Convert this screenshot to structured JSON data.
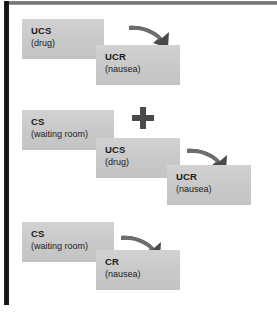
{
  "figure": {
    "colors": {
      "box_fill": "#c9c9c9",
      "box_shadow": "#dcdcdc",
      "text": "#1b1b1b",
      "arrow": "#4a4a4a",
      "plus": "#4a4a4a",
      "left_rule": "#0d0d0d",
      "top_rule": "#6e6e6e",
      "background": "#ffffff"
    },
    "operator_plus": "+"
  },
  "panels": [
    {
      "name": "before-conditioning",
      "boxes": [
        {
          "code": "UCS",
          "desc": "(drug)"
        },
        {
          "code": "UCR",
          "desc": "(nausea)"
        }
      ],
      "arrow": "curved-arrow-down-right-icon"
    },
    {
      "name": "during-conditioning",
      "boxes": [
        {
          "code": "CS",
          "desc": "(waiting room)"
        },
        {
          "code": "UCS",
          "desc": "(drug)"
        },
        {
          "code": "UCR",
          "desc": "(nausea)"
        }
      ],
      "arrow": "curved-arrow-down-right-icon",
      "operator": "+"
    },
    {
      "name": "after-conditioning",
      "boxes": [
        {
          "code": "CS",
          "desc": "(waiting room)"
        },
        {
          "code": "CR",
          "desc": "(nausea)"
        }
      ],
      "arrow": "curved-arrow-down-right-icon"
    }
  ]
}
